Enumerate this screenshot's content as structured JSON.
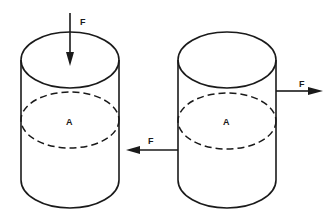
{
  "diagram": {
    "title": "",
    "colors": {
      "stroke": "#1a1a1a",
      "background": "#ffffff"
    },
    "cylinders": [
      {
        "id": "left",
        "section_label": "A",
        "force": {
          "label": "F",
          "direction": "down",
          "applied_to": "top-face",
          "description": "normal/compressive force perpendicular to cross-section"
        },
        "secondary_force": {
          "label": "F",
          "direction": "left",
          "applied_to": "side"
        }
      },
      {
        "id": "right",
        "section_label": "A",
        "force": {
          "label": "F",
          "direction": "right",
          "applied_to": "side",
          "description": "shear force parallel to cross-section"
        }
      }
    ]
  }
}
